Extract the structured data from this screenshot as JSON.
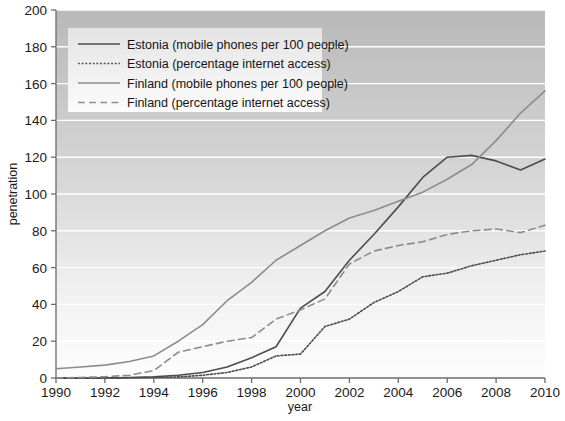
{
  "chart_data": {
    "type": "line",
    "title": "",
    "xlabel": "year",
    "ylabel": "penetration",
    "xlim": [
      1990,
      2010
    ],
    "ylim": [
      0,
      200
    ],
    "xticks": [
      1990,
      1992,
      1994,
      1996,
      1998,
      2000,
      2002,
      2004,
      2006,
      2008,
      2010
    ],
    "yticks": [
      0,
      20,
      40,
      60,
      80,
      100,
      120,
      140,
      160,
      180,
      200
    ],
    "grid": "horizontal-white-gridlines",
    "legend_position": "upper-left-inside",
    "x": [
      1990,
      1991,
      1992,
      1993,
      1994,
      1995,
      1996,
      1997,
      1998,
      1999,
      2000,
      2001,
      2002,
      2003,
      2004,
      2005,
      2006,
      2007,
      2008,
      2009,
      2010
    ],
    "series": [
      {
        "name": "Estonia (mobile phones per 100 people)",
        "style": "solid",
        "color": "#4d4d4d",
        "width": 1.6,
        "values": [
          0,
          0,
          0,
          0.3,
          0.7,
          1.5,
          3,
          6,
          11,
          17,
          38,
          47,
          64,
          78,
          93,
          109,
          120,
          121,
          118,
          113,
          119
        ]
      },
      {
        "name": "Estonia (percentage internet access)",
        "style": "dotted",
        "color": "#4d4d4d",
        "width": 1.6,
        "values": [
          0,
          0,
          0,
          0.1,
          0.3,
          0.6,
          1.5,
          3,
          6,
          12,
          13,
          28,
          32,
          41,
          47,
          55,
          57,
          61,
          64,
          67,
          69
        ]
      },
      {
        "name": "Finland (mobile phones per 100 people)",
        "style": "solid",
        "color": "#8c8c8c",
        "width": 1.6,
        "values": [
          5,
          6,
          7,
          9,
          12,
          20,
          29,
          42,
          52,
          64,
          72,
          80,
          87,
          91,
          96,
          101,
          108,
          116,
          129,
          144,
          156
        ]
      },
      {
        "name": "Finland (percentage internet access)",
        "style": "dashed",
        "color": "#8c8c8c",
        "width": 1.6,
        "values": [
          0,
          0.3,
          0.7,
          1.5,
          4,
          14,
          17,
          20,
          22,
          32,
          37,
          43,
          62,
          69,
          72,
          74,
          78,
          80,
          81,
          79,
          83
        ]
      }
    ]
  },
  "axes": {
    "y_axis_title": "penetration",
    "x_axis_title": "year",
    "y_tick_labels": [
      "0",
      "20",
      "40",
      "60",
      "80",
      "100",
      "120",
      "140",
      "160",
      "180",
      "200"
    ],
    "x_tick_labels": [
      "1990",
      "1992",
      "1994",
      "1996",
      "1998",
      "2000",
      "2002",
      "2004",
      "2006",
      "2008",
      "2010"
    ]
  },
  "legend": {
    "items": [
      {
        "label": "Estonia (mobile phones per 100 people)",
        "style": "solid",
        "color": "#4d4d4d"
      },
      {
        "label": "Estonia (percentage internet access)",
        "style": "dotted",
        "color": "#4d4d4d"
      },
      {
        "label": "Finland (mobile phones per 100 people)",
        "style": "solid",
        "color": "#8c8c8c"
      },
      {
        "label": "Finland (percentage internet access)",
        "style": "dashed",
        "color": "#8c8c8c"
      }
    ]
  },
  "colors": {
    "plot_bg_top": "#b9b9b9",
    "plot_bg_bottom": "#fdfdfd",
    "gridline": "#ffffff",
    "axis": "#6b6b6b",
    "legend_bg_top": "#e2e2e2",
    "legend_bg_bottom": "#fbfbfb",
    "estonia": "#4d4d4d",
    "finland": "#8c8c8c"
  }
}
